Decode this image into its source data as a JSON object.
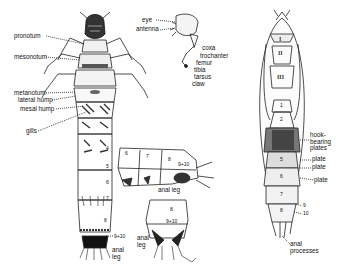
{
  "figure": {
    "larva_dorsal": {
      "labels": {
        "pronotum": "pronotum",
        "mesonotum": "mesonotum",
        "metanotum": "metanotum",
        "lateral_hump": "lateral hump",
        "mesal_hump": "mesal hump",
        "gills": "gills",
        "anal_leg": "anal\nleg",
        "seg_9_10": "9+10"
      },
      "segment_numbers": [
        "4",
        "5",
        "6",
        "7",
        "8"
      ]
    },
    "head_leg_detail": {
      "labels": {
        "eye": "eye",
        "antenna": "antenna",
        "coxa": "coxa",
        "trochanter": "trochanter",
        "femur": "femur",
        "tibia": "tibia",
        "tarsus": "tarsus",
        "claw": "claw"
      }
    },
    "abdomen_lateral": {
      "labels": {
        "anal_leg": "anal leg",
        "seg_9_10": "9+10"
      },
      "segment_numbers": [
        "6",
        "7",
        "8"
      ]
    },
    "abdomen_ventral": {
      "labels": {
        "anal_leg": "anal\nleg",
        "seg_8": "8",
        "seg_9_10": "9+10"
      }
    },
    "pupa": {
      "thorax_numerals": [
        "I",
        "II",
        "III"
      ],
      "abdomen_numbers": [
        "1",
        "2",
        "5",
        "6",
        "7",
        "8"
      ],
      "labels": {
        "hook_bearing_plates": "hook-\nbearing\nplates",
        "plate1": "plate",
        "plate2": "plate",
        "plate3": "plate",
        "seg9": "9",
        "seg10": "10",
        "anal_processes": "anal\nprocesses"
      }
    }
  }
}
